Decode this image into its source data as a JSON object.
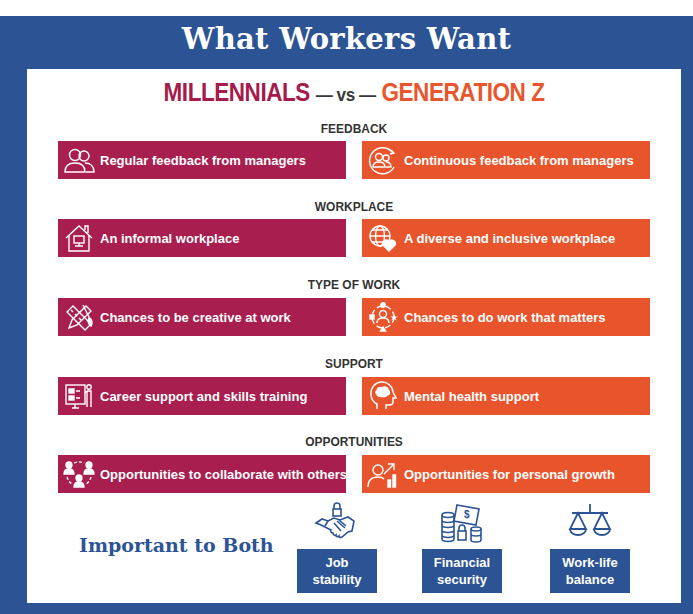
{
  "title": "What Workers Want",
  "comparison": {
    "left": "MILLENNIALS",
    "separator": "— vs —",
    "right": "GENERATION Z"
  },
  "colors": {
    "frame": "#2c5494",
    "millennials": "#a81e4e",
    "generation_z": "#e8552c"
  },
  "sections": [
    {
      "heading": "FEEDBACK",
      "millennials": {
        "icon": "two-people-icon",
        "text": "Regular feedback from managers"
      },
      "generation_z": {
        "icon": "people-cycle-icon",
        "text": "Continuous feedback from managers"
      }
    },
    {
      "heading": "WORKPLACE",
      "millennials": {
        "icon": "house-computer-icon",
        "text": "An informal workplace"
      },
      "generation_z": {
        "icon": "globe-heart-icon",
        "text": "A diverse and inclusive workplace"
      }
    },
    {
      "heading": "TYPE OF WORK",
      "millennials": {
        "icon": "pencil-ruler-brush-icon",
        "text": "Chances to be creative at work"
      },
      "generation_z": {
        "icon": "person-shapes-cycle-icon",
        "text": "Chances to do work that matters"
      }
    },
    {
      "heading": "SUPPORT",
      "millennials": {
        "icon": "presentation-board-icon",
        "text": "Career support and skills training"
      },
      "generation_z": {
        "icon": "head-brain-icon",
        "text": "Mental health support"
      }
    },
    {
      "heading": "OPPORTUNITIES",
      "millennials": {
        "icon": "team-collaboration-icon",
        "text": "Opportunities to collaborate with others"
      },
      "generation_z": {
        "icon": "person-growth-chart-icon",
        "text": "Opportunities for personal growth"
      }
    }
  ],
  "both": {
    "label": "Important to Both",
    "items": [
      {
        "icon": "handshake-lock-icon",
        "line1": "Job",
        "line2": "stability"
      },
      {
        "icon": "coins-money-lock-icon",
        "line1": "Financial",
        "line2": "security"
      },
      {
        "icon": "balance-scale-icon",
        "line1": "Work-life",
        "line2": "balance"
      }
    ]
  }
}
